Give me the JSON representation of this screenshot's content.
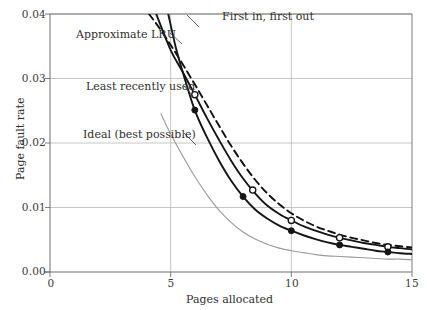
{
  "chart_data": {
    "type": "line",
    "title": "",
    "xlabel": "Pages allocated",
    "ylabel": "Page fault rate",
    "xlim": [
      0,
      15
    ],
    "ylim": [
      0,
      0.04
    ],
    "xticks": [
      0,
      5,
      10,
      15
    ],
    "xtick_labels": [
      "0",
      "5",
      "10",
      "15"
    ],
    "yticks": [
      0.0,
      0.01,
      0.02,
      0.03,
      0.04
    ],
    "ytick_labels": [
      "0.00",
      "0.01",
      "0.02",
      "0.03",
      "0.04"
    ],
    "grid": true,
    "legend_position": "inline-annotations",
    "series": [
      {
        "name": "First in, first out",
        "style": "dashed",
        "color": "#111111",
        "marker": "none",
        "x": [
          4.1,
          4.5,
          5.0,
          5.5,
          6.0,
          6.5,
          7.0,
          7.5,
          8.0,
          8.5,
          9.0,
          9.5,
          10.0,
          10.5,
          11.0,
          11.5,
          12.0,
          12.5,
          13.0,
          13.5,
          14.0,
          14.5,
          15.0
        ],
        "y": [
          0.04,
          0.038,
          0.0352,
          0.0322,
          0.0291,
          0.0259,
          0.0227,
          0.0196,
          0.0168,
          0.0143,
          0.0122,
          0.0105,
          0.0091,
          0.008,
          0.0071,
          0.0064,
          0.0058,
          0.0053,
          0.0049,
          0.0045,
          0.0042,
          0.004,
          0.0038
        ]
      },
      {
        "name": "Approximate LRU",
        "style": "solid",
        "color": "#151515",
        "marker": "open-circle",
        "x": [
          4.4,
          5.0,
          5.5,
          6.0,
          6.5,
          7.0,
          7.5,
          8.0,
          8.5,
          9.0,
          9.5,
          10.0,
          10.5,
          11.0,
          11.5,
          12.0,
          12.5,
          13.0,
          13.5,
          14.0,
          14.5,
          15.0
        ],
        "y": [
          0.04,
          0.0344,
          0.031,
          0.0275,
          0.0239,
          0.0205,
          0.0173,
          0.0145,
          0.0122,
          0.0103,
          0.009,
          0.008,
          0.0071,
          0.0064,
          0.0058,
          0.0053,
          0.0049,
          0.0045,
          0.0042,
          0.0039,
          0.0037,
          0.0035
        ],
        "markers_x": [
          6.0,
          8.4,
          10.0,
          12.0,
          14.0
        ],
        "markers_y": [
          0.0275,
          0.0127,
          0.008,
          0.0053,
          0.0039
        ]
      },
      {
        "name": "Least recently used",
        "style": "solid",
        "color": "#151515",
        "marker": "filled-circle",
        "x": [
          4.9,
          5.2,
          5.5,
          6.0,
          6.5,
          7.0,
          7.5,
          8.0,
          8.5,
          9.0,
          9.5,
          10.0,
          10.5,
          11.0,
          11.5,
          12.0,
          12.5,
          13.0,
          13.5,
          14.0,
          14.5,
          15.0
        ],
        "y": [
          0.04,
          0.035,
          0.031,
          0.0251,
          0.0209,
          0.0173,
          0.0142,
          0.0117,
          0.0097,
          0.0083,
          0.0072,
          0.0064,
          0.0057,
          0.0051,
          0.0046,
          0.0042,
          0.0039,
          0.0036,
          0.0033,
          0.0031,
          0.0029,
          0.0028
        ],
        "markers_x": [
          6.0,
          8.0,
          10.0,
          12.0,
          14.0
        ],
        "markers_y": [
          0.0251,
          0.0117,
          0.0064,
          0.0042,
          0.0031
        ]
      },
      {
        "name": "Ideal (best possible)",
        "style": "solid",
        "color": "#9a9a9a",
        "marker": "none",
        "x": [
          4.6,
          5.0,
          5.5,
          6.0,
          6.5,
          7.0,
          7.5,
          8.0,
          8.5,
          9.0,
          9.5,
          10.0,
          10.5,
          11.0,
          11.5,
          12.0,
          12.5,
          13.0,
          13.5,
          14.0,
          14.5,
          15.0
        ],
        "y": [
          0.0245,
          0.0214,
          0.018,
          0.0148,
          0.012,
          0.0096,
          0.0077,
          0.0062,
          0.0051,
          0.0043,
          0.0037,
          0.0033,
          0.003,
          0.0027,
          0.0025,
          0.0024,
          0.0023,
          0.0022,
          0.0021,
          0.002,
          0.002,
          0.0019
        ]
      }
    ],
    "annotations": [
      {
        "text": "First in, first out",
        "x_px": 222,
        "y_px": 12
      },
      {
        "text": "Approximate LRU",
        "x_px": 76,
        "y_px": 30
      },
      {
        "text": "Least recently used",
        "x_px": 86,
        "y_px": 82
      },
      {
        "text": "Ideal (best possible)",
        "x_px": 83,
        "y_px": 130
      }
    ],
    "colors": {
      "axis": "#6e6e6e",
      "grid": "#b8b8b8",
      "ideal": "#9a9a9a",
      "primary": "#151515",
      "background": "#ffffff"
    }
  }
}
